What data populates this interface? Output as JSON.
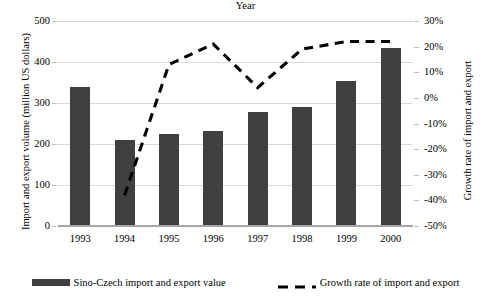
{
  "chart_data": {
    "type": "bar",
    "title": "",
    "xlabel": "Year",
    "ylabel": "Import and export volume (million US dollars)",
    "y2label": "Growth rate of import and export",
    "grid": true,
    "legend_position": "bottom",
    "categories": [
      "1993",
      "1994",
      "1995",
      "1996",
      "1997",
      "1998",
      "1999",
      "2000"
    ],
    "ylim": [
      0,
      500
    ],
    "y_ticks": [
      "0",
      "100",
      "200",
      "300",
      "400",
      "500"
    ],
    "y_tick_values": [
      0,
      100,
      200,
      300,
      400,
      500
    ],
    "y2lim": [
      -50,
      30
    ],
    "y2_ticks": [
      "-50%",
      "-40%",
      "-30%",
      "-20%",
      "-10%",
      "0%",
      "10%",
      "20%",
      "30%"
    ],
    "y2_tick_values": [
      -50,
      -40,
      -30,
      -20,
      -10,
      0,
      10,
      20,
      30
    ],
    "series": [
      {
        "name": "Sino-Czech import and export value",
        "kind": "bar",
        "axis": "left",
        "color": "#404040",
        "values": [
          340,
          210,
          225,
          232,
          278,
          290,
          353,
          433
        ]
      },
      {
        "name": "Growth rate of import and export",
        "kind": "line",
        "style": "dashed",
        "axis": "right",
        "color": "#000000",
        "values": [
          null,
          -38,
          13,
          21,
          4,
          19,
          22,
          22
        ]
      }
    ]
  },
  "legend": {
    "items": [
      {
        "label": "Sino-Czech import and export value",
        "marker": "bar-swatch"
      },
      {
        "label": "Growth rate of import and export",
        "marker": "dashed-line-swatch"
      }
    ]
  }
}
